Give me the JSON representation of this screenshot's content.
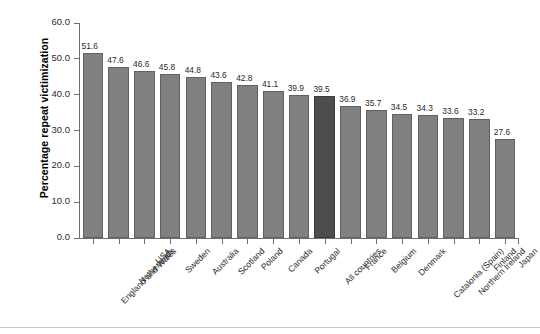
{
  "chart_data": {
    "type": "bar",
    "title": "",
    "xlabel": "",
    "ylabel": "Percentage repeat victimization",
    "ylim": [
      0,
      60
    ],
    "ytick_step": 10,
    "ytick_labels": [
      "0.0",
      "10.0",
      "20.0",
      "30.0",
      "40.0",
      "50.0",
      "60.0"
    ],
    "grid": false,
    "legend": null,
    "categories": [
      "England and Wales",
      "Netherlands",
      "USA",
      "Sweden",
      "Australia",
      "Scotland",
      "Poland",
      "Canada",
      "Portugal",
      "All countries",
      "France",
      "Belgium",
      "Denmark",
      "Catalonia (Spain)",
      "Northern Ireland",
      "Finland",
      "Japan"
    ],
    "values": [
      51.6,
      47.6,
      46.6,
      45.8,
      44.8,
      43.6,
      42.8,
      41.1,
      39.9,
      39.5,
      36.9,
      35.7,
      34.5,
      34.3,
      33.6,
      33.2,
      27.6
    ],
    "value_labels": [
      "51.6",
      "47.6",
      "46.6",
      "45.8",
      "44.8",
      "43.6",
      "42.8",
      "41.1",
      "39.9",
      "39.5",
      "36.9",
      "35.7",
      "34.5",
      "34.3",
      "33.6",
      "33.2",
      "27.6"
    ],
    "highlight_index": 9,
    "colors": {
      "bar": "#808080",
      "bar_border": "#616161",
      "highlight_bar": "#4d4d4d",
      "highlight_bar_border": "#3b3b3b",
      "axis": "#6e6e6e",
      "text": "#2b2b2b",
      "background": "#ffffff",
      "bottom_rule": "#c9c9c9"
    }
  }
}
